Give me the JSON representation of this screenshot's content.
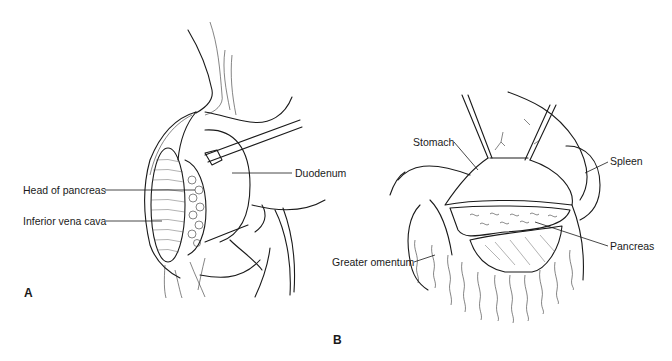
{
  "figure": {
    "panels": [
      {
        "id": "A",
        "letter": "A",
        "labels": {
          "head_of_pancreas": "Head of pancreas",
          "inferior_vena_cava": "Inferior vena cava",
          "duodenum": "Duodenum"
        }
      },
      {
        "id": "B",
        "letter": "B",
        "labels": {
          "stomach": "Stomach",
          "spleen": "Spleen",
          "pancreas": "Pancreas",
          "greater_omentum": "Greater omentum"
        }
      }
    ]
  }
}
